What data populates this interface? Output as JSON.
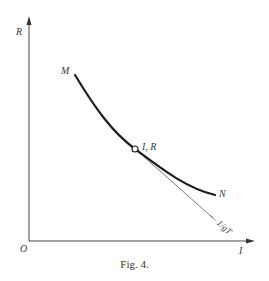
{
  "figure": {
    "caption": "Fig. 4.",
    "axes": {
      "y_label": "R",
      "x_label": "I",
      "origin_label": "O"
    },
    "curve": {
      "start_label": "M",
      "end_label": "N"
    },
    "point": {
      "label": "I, R"
    },
    "tangent": {
      "label": "— 1/gT"
    },
    "colors": {
      "ink": "#2a2a2a",
      "background": "#ffffff"
    }
  }
}
